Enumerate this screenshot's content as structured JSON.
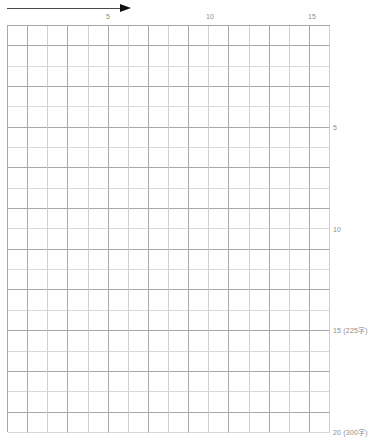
{
  "page": {
    "background_color": "#ffffff",
    "grid_line_color": "#a8a8a8",
    "grid_line_color_light": "#d8d8d8",
    "label_color": "#8d8d8d",
    "arrow_color": "#111111"
  },
  "direction_arrow": {
    "name": "writing-direction-arrow",
    "orientation": "left-to-right",
    "label": ""
  },
  "grid": {
    "columns": 16,
    "rows": 20,
    "cell_width_px": 20.2,
    "cell_height_px": 20.35,
    "total_cells": 320,
    "cells": []
  },
  "column_ruler": {
    "marks": [
      {
        "label": "5",
        "column": 5,
        "x": 108
      },
      {
        "label": "10",
        "column": 10,
        "x": 210
      },
      {
        "label": "15",
        "column": 15,
        "x": 312
      }
    ]
  },
  "row_ruler": {
    "marks": [
      {
        "label": "5",
        "row": 5,
        "y": 127
      },
      {
        "label": "10",
        "row": 10,
        "y": 229
      },
      {
        "label": "15 (225字)",
        "row": 15,
        "y": 330
      },
      {
        "label": "20 (300字)",
        "row": 20,
        "y": 432
      }
    ]
  }
}
